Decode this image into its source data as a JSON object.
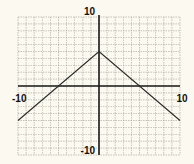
{
  "chart_data": {
    "type": "line",
    "title": "",
    "xlabel": "",
    "ylabel": "",
    "xlim": [
      -10,
      10
    ],
    "ylim": [
      -10,
      10
    ],
    "grid": true,
    "grid_step": 1,
    "function": "y = -|x| + 5",
    "series": [
      {
        "name": "y = -|x| + 5",
        "x": [
          -10,
          0,
          10
        ],
        "y": [
          -5,
          5,
          -5
        ]
      }
    ],
    "tick_labels": {
      "x": [
        {
          "value": -10,
          "label": "-10"
        },
        {
          "value": 10,
          "label": "10"
        }
      ],
      "y": [
        {
          "value": 10,
          "label": "10"
        },
        {
          "value": -10,
          "label": "-10"
        }
      ]
    }
  }
}
